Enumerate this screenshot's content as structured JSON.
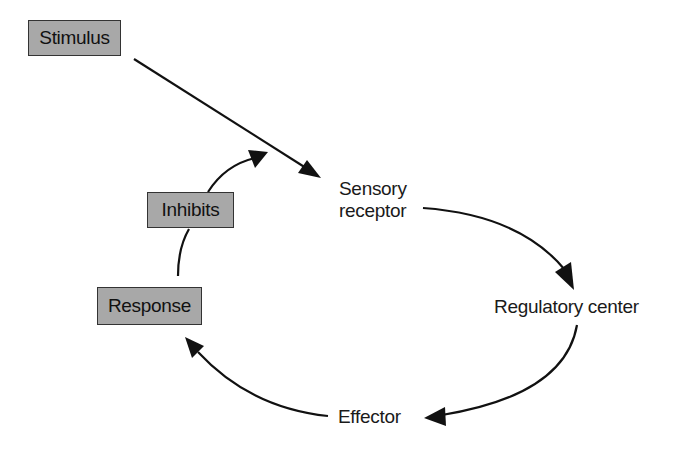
{
  "diagram": {
    "type": "negative-feedback-loop",
    "boxes": {
      "stimulus": "Stimulus",
      "inhibits": "Inhibits",
      "response": "Response"
    },
    "nodes": {
      "sensory_receptor_line1": "Sensory",
      "sensory_receptor_line2": "receptor",
      "regulatory_center": "Regulatory center",
      "effector": "Effector"
    },
    "edges": [
      {
        "from": "Stimulus",
        "to": "Sensory receptor"
      },
      {
        "from": "Sensory receptor",
        "to": "Regulatory center"
      },
      {
        "from": "Regulatory center",
        "to": "Effector"
      },
      {
        "from": "Effector",
        "to": "Response"
      },
      {
        "from": "Response",
        "to": "Stimulus arrow",
        "label": "Inhibits"
      }
    ],
    "colors": {
      "box_fill": "#a8a8a8",
      "box_border": "#333333",
      "arrow": "#111111",
      "text": "#1a1a1a",
      "background": "#ffffff"
    }
  }
}
